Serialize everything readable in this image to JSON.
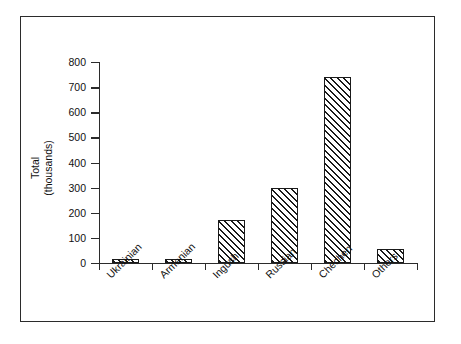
{
  "chart_data": {
    "type": "bar",
    "title": "",
    "subtitle": "",
    "xlabel": "",
    "ylabel": "Total\n(thousands)",
    "ylabel_lines": [
      "Total",
      "(thousands)"
    ],
    "categories": [
      "Ukrainian",
      "Armenian",
      "Ingush",
      "Russian",
      "Chechen",
      "Others"
    ],
    "values": [
      14,
      14,
      170,
      297,
      740,
      55
    ],
    "ylim": [
      0,
      800
    ],
    "yticks": [
      0,
      100,
      200,
      300,
      400,
      500,
      600,
      700,
      800
    ],
    "ytick_labels": [
      "0",
      "100",
      "200",
      "300",
      "400",
      "500",
      "600",
      "700",
      "800"
    ],
    "grid": false,
    "legend": null,
    "legend_position": "none",
    "bar_fill": "diagonal-hatch",
    "bar_fill_color": "#1a1a1a",
    "bar_edge_color": "#1a1a1a",
    "axis_color": "#2b2b2b",
    "background_color": "#ffffff",
    "frame": true,
    "xtick_style": "boundary",
    "xtick_label_rotation": -45
  },
  "figure": {
    "border_color": "#2b2b2b",
    "background": "#ffffff"
  }
}
